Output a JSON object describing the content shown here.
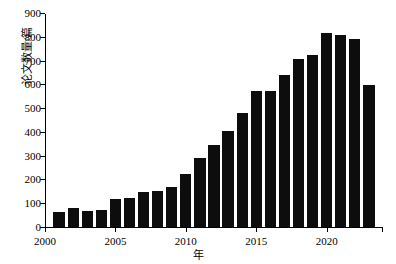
{
  "chart_data": {
    "type": "bar",
    "title": "",
    "xlabel": "年",
    "ylabel": "论文数量/篇",
    "ylim": [
      0,
      900
    ],
    "ytick_step": 100,
    "yticks": [
      0,
      100,
      200,
      300,
      400,
      500,
      600,
      700,
      800,
      900
    ],
    "xlim": [
      2000,
      2024
    ],
    "xticks": [
      2000,
      2005,
      2010,
      2015,
      2020
    ],
    "xtick_labels": [
      "2000",
      "2005",
      "2010",
      "2015",
      "2020"
    ],
    "grid": false,
    "legend": false,
    "bar_color": "#0d0d0d",
    "categories": [
      "2001",
      "2002",
      "2003",
      "2004",
      "2005",
      "2006",
      "2007",
      "2008",
      "2009",
      "2010",
      "2011",
      "2012",
      "2013",
      "2014",
      "2015",
      "2016",
      "2017",
      "2018",
      "2019",
      "2020",
      "2021",
      "2022",
      "2023"
    ],
    "values": [
      62,
      78,
      66,
      72,
      118,
      122,
      146,
      152,
      170,
      222,
      290,
      345,
      405,
      480,
      570,
      570,
      640,
      705,
      725,
      815,
      808,
      790,
      598
    ]
  },
  "axis": {
    "y_label_text": "论文数量/篇",
    "x_label_text": "年"
  }
}
